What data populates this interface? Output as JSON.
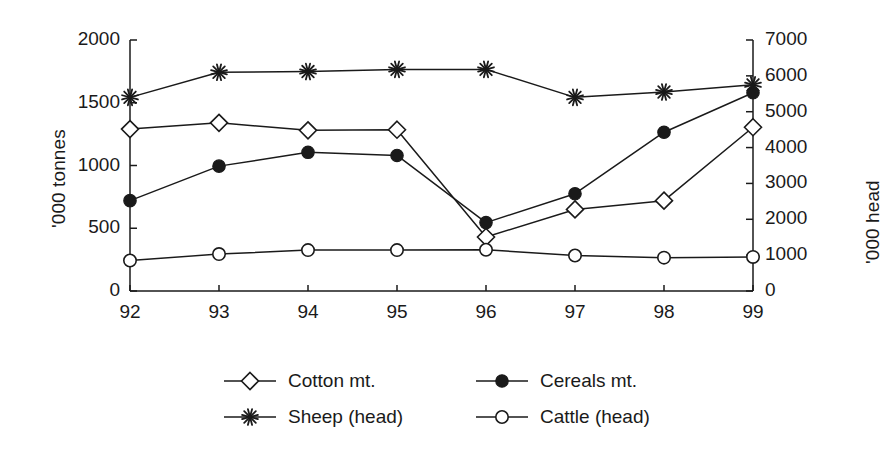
{
  "chart_data": {
    "type": "line",
    "title": "",
    "subtitle": "",
    "xlabel": "",
    "ylabel": "'000 tonnes",
    "y2label": "'000 head",
    "categories": [
      "92",
      "93",
      "94",
      "95",
      "96",
      "97",
      "98",
      "99"
    ],
    "x_tick_labels": [
      "92",
      "93",
      "94",
      "95",
      "96",
      "97",
      "98",
      "99"
    ],
    "y_tick_labels": [
      "0",
      "500",
      "1000",
      "1500",
      "2000"
    ],
    "y2_tick_labels": [
      "0",
      "1000",
      "2000",
      "3000",
      "4000",
      "5000",
      "6000",
      "7000"
    ],
    "ylim": [
      0,
      2000
    ],
    "y2lim": [
      0,
      7000
    ],
    "grid": false,
    "legend_position": "bottom",
    "series": [
      {
        "name": "Cotton mt.",
        "axis": "left",
        "marker": "open-diamond",
        "color": "#1a1a1a",
        "values": [
          1290,
          1340,
          1280,
          1285,
          430,
          650,
          720,
          1305
        ]
      },
      {
        "name": "Cereals mt.",
        "axis": "left",
        "marker": "filled-circle",
        "color": "#1a1a1a",
        "values": [
          720,
          995,
          1105,
          1080,
          545,
          775,
          1265,
          1580
        ]
      },
      {
        "name": "Sheep (head)",
        "axis": "right",
        "marker": "asterisk",
        "color": "#1a1a1a",
        "values": [
          5400,
          6100,
          6120,
          6180,
          6180,
          5400,
          5550,
          5750
        ]
      },
      {
        "name": "Cattle (head)",
        "axis": "right",
        "marker": "open-circle",
        "color": "#1a1a1a",
        "values": [
          850,
          1030,
          1140,
          1140,
          1150,
          990,
          930,
          950
        ]
      }
    ]
  },
  "legend": {
    "entries": [
      {
        "label": "Cotton mt.",
        "marker": "open-diamond"
      },
      {
        "label": "Cereals mt.",
        "marker": "filled-circle"
      },
      {
        "label": "Sheep (head)",
        "marker": "asterisk"
      },
      {
        "label": "Cattle (head)",
        "marker": "open-circle"
      }
    ]
  },
  "colors": {
    "ink": "#1a1a1a",
    "background": "#ffffff"
  }
}
